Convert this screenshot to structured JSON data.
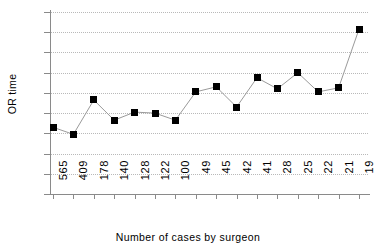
{
  "chart_data": {
    "type": "line",
    "title": "",
    "xlabel": "Number of cases by surgeon",
    "ylabel": "OR time",
    "categories": [
      "565",
      "409",
      "178",
      "140",
      "128",
      "122",
      "100",
      "49",
      "45",
      "42",
      "41",
      "28",
      "25",
      "22",
      "21",
      "19"
    ],
    "values": [
      66,
      59,
      93,
      73,
      81,
      80,
      73,
      101,
      106,
      86,
      115,
      104,
      120,
      101,
      105,
      163
    ],
    "ylim": [
      0,
      180
    ],
    "ytick_step": 20,
    "yticks": [
      "180",
      "160",
      "140",
      "120",
      "100",
      "80",
      "60",
      "40",
      "20",
      "0"
    ],
    "grid": true,
    "legend": "none",
    "marker": "square",
    "marker_color": "#000000",
    "line_color": "#9a9a9a"
  },
  "axes": {
    "y_title": "OR time",
    "x_title": "Number of cases by surgeon"
  }
}
